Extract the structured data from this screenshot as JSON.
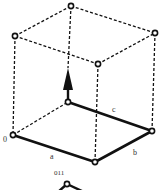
{
  "diagram": {
    "type": "unit-cell-parallelepiped",
    "edge_labels": {
      "a": "a",
      "b": "b",
      "c": "c"
    },
    "origin_label": "0",
    "caption": "011",
    "colors": {
      "line": "#111111",
      "vertex_fill": "#ffffff",
      "label": "#333333"
    },
    "vertices": {
      "bottom": {
        "origin": [
          13,
          135
        ],
        "front": [
          95,
          162
        ],
        "right": [
          152,
          131
        ],
        "back": [
          68,
          102
        ]
      },
      "top": {
        "left": [
          15,
          36
        ],
        "front": [
          98,
          64
        ],
        "right": [
          155,
          33
        ],
        "back": [
          71,
          6
        ]
      }
    },
    "arrow": {
      "from": [
        68,
        100
      ],
      "to": [
        68,
        68
      ],
      "direction": "up"
    }
  }
}
